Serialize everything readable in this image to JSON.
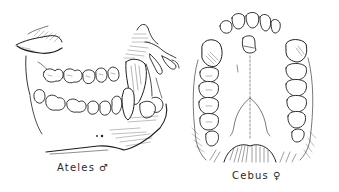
{
  "figures": [
    {
      "id": "ateles",
      "view": "lateral view of jaws",
      "caption": {
        "genus": "Ateles",
        "sex_symbol": "♂"
      }
    },
    {
      "id": "cebus",
      "view": "palatal view of upper dentition",
      "caption": {
        "genus": "Cebus",
        "sex_symbol": "♀"
      }
    }
  ],
  "colors": {
    "ink": "#1e1e1e",
    "background": "#ffffff"
  }
}
